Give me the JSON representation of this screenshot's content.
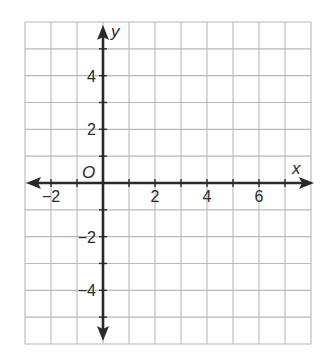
{
  "chart_data": {
    "type": "scatter",
    "title": "",
    "xlabel": "x",
    "ylabel": "y",
    "origin_label": "O",
    "xlim": [
      -3,
      8
    ],
    "ylim": [
      -6,
      6
    ],
    "grid": true,
    "grid_step": 1,
    "x_ticks": [
      -2,
      2,
      4,
      6
    ],
    "x_tick_labels": [
      "−2",
      "2",
      "4",
      "6"
    ],
    "y_ticks": [
      4,
      2,
      -2,
      -4
    ],
    "y_tick_labels": [
      "4",
      "2",
      "−2",
      "−4"
    ],
    "points": [],
    "series": []
  },
  "colors": {
    "grid": "#b8b8b8",
    "axis": "#2a2a2a",
    "background": "#ffffff"
  }
}
